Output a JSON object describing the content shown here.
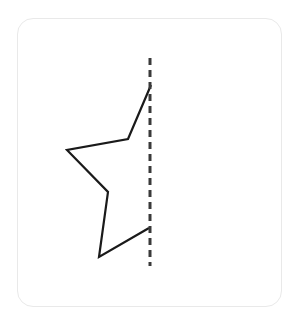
{
  "canvas": {
    "width": 300,
    "height": 325,
    "background_color": "#ffffff"
  },
  "card": {
    "name": "figure-card",
    "x": 17,
    "y": 18,
    "width": 265,
    "height": 289,
    "corner_radius": 16,
    "border_color": "#e9e9e9",
    "fill_color": "#ffffff"
  },
  "figure": {
    "title": "",
    "shape": {
      "name": "half-star-outline",
      "type": "polyline",
      "closed": false,
      "stroke_color": "#1a1a1a",
      "stroke_width": 2.2,
      "fill": "none",
      "points": [
        [
          151,
          85
        ],
        [
          128,
          139
        ],
        [
          67,
          150
        ],
        [
          108,
          192
        ],
        [
          99,
          257
        ],
        [
          149,
          228
        ]
      ],
      "points_label": "top-point, upper-inner-notch, left-point, middle-inner-notch, bottom-left-point, lower-inner-notch"
    },
    "symmetry_line": {
      "name": "mirror-line",
      "type": "dashed-line",
      "orientation": "vertical",
      "x": 150,
      "y_start": 58,
      "y_end": 266,
      "stroke_color": "#3a3a3a",
      "stroke_width": 3,
      "dash_length": 7,
      "gap_length": 5
    }
  }
}
